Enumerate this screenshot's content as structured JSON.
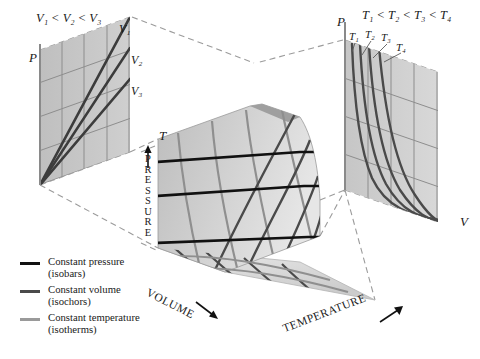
{
  "figure": {
    "headers": {
      "volume_inequality": "V₁ < V₂ < V₃",
      "temperature_inequality": "T₁ < T₂ < T₃ < T₄"
    },
    "axes": {
      "left_panel_vertical": "P",
      "left_panel_horizontal": "T",
      "right_panel_vertical": "P",
      "right_panel_horizontal": "V",
      "surface_vertical": "PRESSURE",
      "surface_left_edge": "VOLUME",
      "surface_right_edge": "TEMPERATURE"
    },
    "isochor_labels": [
      "V₁",
      "V₂",
      "V₃"
    ],
    "isotherm_labels": [
      "T₁",
      "T₂",
      "T₃",
      "T₄"
    ],
    "legend": [
      {
        "swatch_color": "#111111",
        "line1": "Constant pressure",
        "line2": "(isobars)"
      },
      {
        "swatch_color": "#4a4a4a",
        "line1": "Constant volume",
        "line2": "(isochors)"
      },
      {
        "swatch_color": "#9a9a9a",
        "line1": "Constant temperature",
        "line2": "(isotherms)"
      }
    ],
    "colors": {
      "isobar": "#111111",
      "isochor": "#4a4a4a",
      "isotherm": "#8f8f8f",
      "surface_light": "#d7d7d7",
      "surface_mid": "#c2c2c2",
      "surface_dark": "#a8a8a8",
      "panel_fill": "#c9c9c9",
      "projection_dash": "#9b9b9b",
      "text": "#1a1a1a"
    }
  },
  "chart_data": {
    "type": "line",
    "xlabel": "VOLUME / TEMPERATURE",
    "ylabel": "PRESSURE",
    "left_projection": {
      "plane": "P-T",
      "xlabel": "T",
      "ylabel": "P",
      "curve_family": "isochors (constant volume)",
      "series": [
        {
          "name": "V₁",
          "slope_rank": 1,
          "description": "steepest line through origin"
        },
        {
          "name": "V₂",
          "slope_rank": 2,
          "description": "intermediate line through origin"
        },
        {
          "name": "V₃",
          "slope_rank": 3,
          "description": "shallowest line through origin"
        }
      ],
      "ordering": "V₁ < V₂ < V₃"
    },
    "right_projection": {
      "plane": "P-V",
      "xlabel": "V",
      "ylabel": "P",
      "curve_family": "isotherms (constant temperature)",
      "series": [
        {
          "name": "T₁",
          "hyperbola_rank": 1,
          "description": "lowest hyperbola PV = const"
        },
        {
          "name": "T₂",
          "hyperbola_rank": 2,
          "description": "second hyperbola"
        },
        {
          "name": "T₃",
          "hyperbola_rank": 3,
          "description": "third hyperbola"
        },
        {
          "name": "T₄",
          "hyperbola_rank": 4,
          "description": "highest hyperbola"
        }
      ],
      "ordering": "T₁ < T₂ < T₃ < T₄"
    },
    "surface": {
      "equation": "PV = nRT",
      "grid_families": [
        "isobars",
        "isochors",
        "isotherms"
      ],
      "isobar_count": 3,
      "isochor_count": 4,
      "isotherm_count": 4
    },
    "legend_position": "bottom-left",
    "grid": true
  }
}
